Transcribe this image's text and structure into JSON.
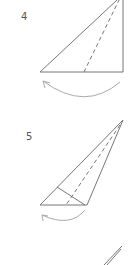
{
  "steps": [
    {
      "number": "4"
    },
    {
      "number": "5"
    }
  ],
  "colors": {
    "line": "#777777",
    "arrow": "#aaaaaa"
  }
}
